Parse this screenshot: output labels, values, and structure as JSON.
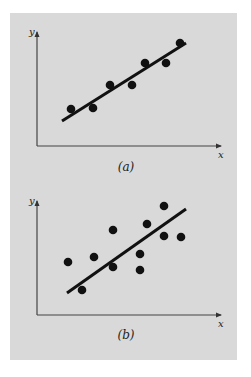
{
  "panel": {
    "background": "#d9d9d9",
    "ink": "#111111"
  },
  "chart_data": [
    {
      "type": "scatter",
      "caption": "(a)",
      "xlabel": "x",
      "ylabel": "y",
      "grid": false,
      "ticks": false,
      "description": "Data points closely following a linear trend",
      "points_px": [
        [
          71,
          109
        ],
        [
          93,
          108
        ],
        [
          110,
          85
        ],
        [
          132,
          85
        ],
        [
          145,
          63
        ],
        [
          166,
          63
        ],
        [
          180,
          43
        ]
      ],
      "points": [
        {
          "x": 0.19,
          "y": 0.33
        },
        {
          "x": 0.3,
          "y": 0.33
        },
        {
          "x": 0.4,
          "y": 0.54
        },
        {
          "x": 0.52,
          "y": 0.54
        },
        {
          "x": 0.59,
          "y": 0.73
        },
        {
          "x": 0.71,
          "y": 0.73
        },
        {
          "x": 0.78,
          "y": 0.91
        }
      ],
      "fit_line_px": [
        [
          62,
          121
        ],
        [
          186,
          43
        ]
      ],
      "axis_px": {
        "origin": [
          37,
          146
        ],
        "x_end": 221,
        "y_end": 32
      },
      "caption_px": [
        126,
        171
      ],
      "xlabel_px": [
        218,
        158
      ],
      "ylabel_px": [
        29,
        35
      ]
    },
    {
      "type": "scatter",
      "caption": "(b)",
      "xlabel": "x",
      "ylabel": "y",
      "grid": false,
      "ticks": false,
      "description": "Data points widely scattered about a linear trend",
      "points_px": [
        [
          68,
          262
        ],
        [
          82,
          290
        ],
        [
          94,
          257
        ],
        [
          113,
          230
        ],
        [
          113,
          267
        ],
        [
          140,
          254
        ],
        [
          140,
          270
        ],
        [
          147,
          224
        ],
        [
          164,
          206
        ],
        [
          164,
          236
        ],
        [
          181,
          237
        ]
      ],
      "points": [
        {
          "x": 0.17,
          "y": 0.46
        },
        {
          "x": 0.24,
          "y": 0.22
        },
        {
          "x": 0.31,
          "y": 0.51
        },
        {
          "x": 0.41,
          "y": 0.75
        },
        {
          "x": 0.41,
          "y": 0.42
        },
        {
          "x": 0.56,
          "y": 0.54
        },
        {
          "x": 0.56,
          "y": 0.39
        },
        {
          "x": 0.6,
          "y": 0.8
        },
        {
          "x": 0.69,
          "y": 0.96
        },
        {
          "x": 0.69,
          "y": 0.7
        },
        {
          "x": 0.78,
          "y": 0.69
        }
      ],
      "fit_line_px": [
        [
          67,
          293
        ],
        [
          186,
          209
        ]
      ],
      "axis_px": {
        "origin": [
          37,
          315
        ],
        "x_end": 221,
        "y_end": 201
      },
      "caption_px": [
        126,
        339
      ],
      "xlabel_px": [
        218,
        327
      ],
      "ylabel_px": [
        29,
        204
      ]
    }
  ]
}
